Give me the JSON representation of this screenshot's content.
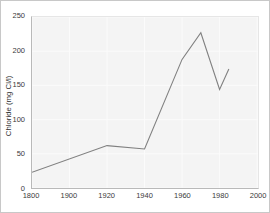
{
  "chart_data": {
    "type": "line",
    "title": "",
    "subtitle": "",
    "xlabel": "",
    "ylabel": "Chloride (mg Cl/l)",
    "xlim": [
      1800,
      2000
    ],
    "ylim": [
      0,
      250
    ],
    "grid": true,
    "grid_color": "#fbfbfb",
    "plot_background": "#f4f4f4",
    "legend": false,
    "legend_position": "none",
    "x_axis_note": "non-linear axis: 1800 then 20-year steps from 1900",
    "x_tick_labels": [
      "1800",
      "1900",
      "1920",
      "1940",
      "1960",
      "1980",
      "2000"
    ],
    "x_tick_positions_pct": [
      0,
      16.6,
      33.2,
      49.8,
      66.4,
      83.0,
      99.6
    ],
    "y_tick_labels": [
      "0",
      "50",
      "100",
      "150",
      "200",
      "250"
    ],
    "y_tick_values": [
      0,
      50,
      100,
      150,
      200,
      250
    ],
    "series": [
      {
        "name": "Chloride",
        "color": "#808080",
        "line_width": 1.1,
        "markers": false,
        "x": [
          1800,
          1920,
          1940,
          1960,
          1970,
          1980,
          1985
        ],
        "x_pct": [
          0,
          33.2,
          49.8,
          66.4,
          74.7,
          83.0,
          87.1
        ],
        "values": [
          23,
          62,
          57,
          188,
          227,
          144,
          174
        ]
      }
    ]
  }
}
